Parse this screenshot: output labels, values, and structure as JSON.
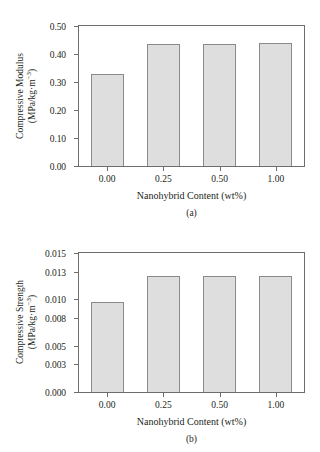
{
  "chart_data": [
    {
      "type": "bar",
      "panel": "(a)",
      "title": "",
      "categories": [
        "0.00",
        "0.25",
        "0.50",
        "1.00"
      ],
      "values": [
        0.33,
        0.437,
        0.435,
        0.44
      ],
      "xlabel": "Nanohybrid Content (wt%)",
      "ylabel_line1": "Compressive Modulus",
      "ylabel_line2": "(MPa/kg·m",
      "ylabel_line2_sup": "−3",
      "ylabel_line2_end": ")",
      "ylim": [
        0.0,
        0.5
      ],
      "yticks": [
        "0.00",
        "0.10",
        "0.20",
        "0.30",
        "0.40",
        "0.50"
      ],
      "ytick_values": [
        0.0,
        0.1,
        0.2,
        0.3,
        0.4,
        0.5
      ],
      "grid": false,
      "legend": null
    },
    {
      "type": "bar",
      "panel": "(b)",
      "title": "",
      "categories": [
        "0.00",
        "0.25",
        "0.50",
        "1.00"
      ],
      "values": [
        0.0097,
        0.0125,
        0.0125,
        0.0125
      ],
      "xlabel": "Nanohybrid Content (wt%)",
      "ylabel_line1": "Compressive Strength",
      "ylabel_line2": "(MPa/kg·m",
      "ylabel_line2_sup": "−3",
      "ylabel_line2_end": ")",
      "ylim": [
        0.0,
        0.015
      ],
      "yticks": [
        "0.000",
        "0.003",
        "0.005",
        "0.008",
        "0.010",
        "0.013",
        "0.015"
      ],
      "ytick_values": [
        0.0,
        0.003,
        0.005,
        0.008,
        0.01,
        0.013,
        0.015
      ],
      "grid": false,
      "legend": null
    }
  ],
  "style": {
    "bar_fill": "#dedede",
    "bar_stroke": "#8a8a8a",
    "axis_color": "#6d6d6d",
    "text_color": "#231f20",
    "background": "#ffffff"
  }
}
